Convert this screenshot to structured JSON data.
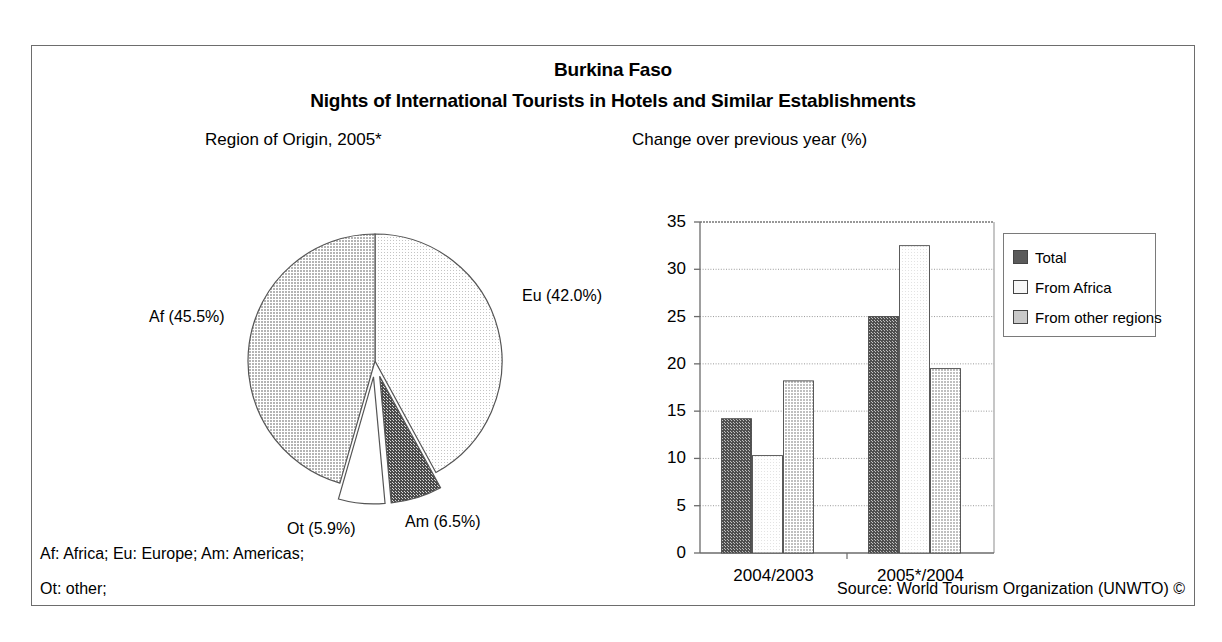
{
  "header": {
    "country": "Burkina Faso",
    "subject": "Nights of International Tourists in Hotels and Similar Establishments"
  },
  "pie_panel": {
    "title": "Region of Origin, 2005*"
  },
  "bar_panel": {
    "title": "Change over previous year (%)"
  },
  "legend": {
    "items": [
      {
        "label": "Total",
        "color": "#5a5a5a"
      },
      {
        "label": "From Africa",
        "color": "#f2f2f2"
      },
      {
        "label": "From other regions",
        "color": "#c9c9c9"
      }
    ]
  },
  "footnotes": {
    "line1": "Af: Africa; Eu: Europe; Am: Americas;",
    "line2": "Ot: other;",
    "source": "Source: World Tourism Organization (UNWTO) ©"
  },
  "chart_data": [
    {
      "type": "pie",
      "title": "Region of Origin, 2005*",
      "unit": "%",
      "start_angle_deg": 0,
      "direction": "clockwise",
      "exploded": [
        "Am",
        "Ot"
      ],
      "categories": [
        "Eu",
        "Am",
        "Ot",
        "Af"
      ],
      "labels": [
        "Eu (42.0%)",
        "Am (6.5%)",
        "Ot (5.9%)",
        "Af (45.5%)"
      ],
      "values": [
        42.0,
        6.5,
        5.9,
        45.5
      ],
      "colors": [
        "#f0f0f0",
        "#585858",
        "#ffffff",
        "#c8c8c8"
      ],
      "legend": "none"
    },
    {
      "type": "bar",
      "title": "Change over previous year (%)",
      "xlabel": "",
      "ylabel": "",
      "ylim": [
        0,
        35
      ],
      "yticks": [
        0,
        5,
        10,
        15,
        20,
        25,
        30,
        35
      ],
      "grid": true,
      "legend_position": "right",
      "categories": [
        "2004/2003",
        "2005*/2004"
      ],
      "series": [
        {
          "name": "Total",
          "values": [
            14.2,
            25.0
          ],
          "color": "#5a5a5a"
        },
        {
          "name": "From Africa",
          "values": [
            10.3,
            32.5
          ],
          "color": "#f2f2f2"
        },
        {
          "name": "From other regions",
          "values": [
            18.2,
            19.5
          ],
          "color": "#c9c9c9"
        }
      ]
    }
  ]
}
